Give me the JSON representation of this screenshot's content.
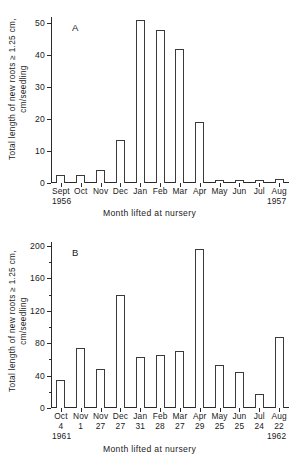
{
  "figure": {
    "axis_title_x": "Month lifted at nursery",
    "axis_title_y_line1": "Total length of new roots ≥ 1.25 cm,",
    "axis_title_y_line2": "cm/seedling"
  },
  "chart_data": [
    {
      "type": "bar",
      "panel": "A",
      "title": "",
      "xlabel": "Month lifted at nursery",
      "ylabel": "Total length of new roots ≥ 1.25 cm, cm/seedling",
      "categories": [
        "Sept",
        "Oct",
        "Nov",
        "Dec",
        "Jan",
        "Feb",
        "Mar",
        "Apr",
        "May",
        "Jun",
        "Jul",
        "Aug"
      ],
      "values": [
        2.5,
        2.5,
        4.0,
        13.5,
        51.0,
        48.0,
        42.0,
        19.2,
        0.8,
        1.0,
        1.0,
        1.2
      ],
      "ylim": [
        0,
        52
      ],
      "yticks": [
        0,
        10,
        20,
        30,
        40,
        50
      ],
      "ytick_labels": [
        "0",
        "10",
        "20",
        "30",
        "40",
        "50"
      ],
      "grid": false,
      "legend": "none",
      "start_year": "1956",
      "end_year": "1957"
    },
    {
      "type": "bar",
      "panel": "B",
      "title": "",
      "xlabel": "Month lifted at nursery",
      "ylabel": "Total length of new roots ≥ 1.25 cm, cm/seedling",
      "categories": [
        "Oct",
        "Nov",
        "Nov",
        "Dec",
        "Jan",
        "Feb",
        "Mar",
        "Apr",
        "May",
        "Jun",
        "Jul",
        "Aug"
      ],
      "days": [
        "4",
        "1",
        "27",
        "27",
        "31",
        "28",
        "27",
        "29",
        "25",
        "25",
        "24",
        "22"
      ],
      "values": [
        35,
        74,
        48,
        140,
        63,
        66,
        70,
        196,
        53,
        44,
        17,
        88
      ],
      "ylim": [
        0,
        205
      ],
      "yticks": [
        0,
        40,
        80,
        120,
        160,
        200
      ],
      "ytick_labels": [
        "0",
        "40",
        "80",
        "120",
        "160",
        "200"
      ],
      "yticks_minor": [
        20,
        60,
        100,
        140,
        180
      ],
      "grid": false,
      "legend": "none",
      "start_year": "1961",
      "end_year": "1962"
    }
  ]
}
